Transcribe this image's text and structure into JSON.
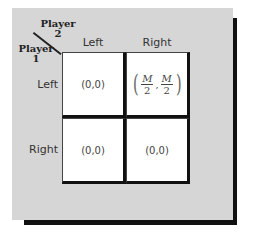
{
  "figure": {
    "player2_label": "Player",
    "player2_number": "2",
    "player1_label": "Player",
    "player1_number": "1",
    "column_headers": [
      "Left",
      "Right"
    ],
    "row_headers": [
      "Left",
      "Right"
    ],
    "payoffs": [
      [
        {
          "text": "(0,0)"
        },
        {
          "text": "",
          "fraction": {
            "num1": "M",
            "den1": "2",
            "num2": "M",
            "den2": "2"
          }
        }
      ],
      [
        {
          "text": "(0,0)"
        },
        {
          "text": "(0,0)"
        }
      ]
    ]
  },
  "colors": {
    "panel": "#d6d6d6",
    "shadow": "#111111",
    "cell": "#ffffff"
  }
}
